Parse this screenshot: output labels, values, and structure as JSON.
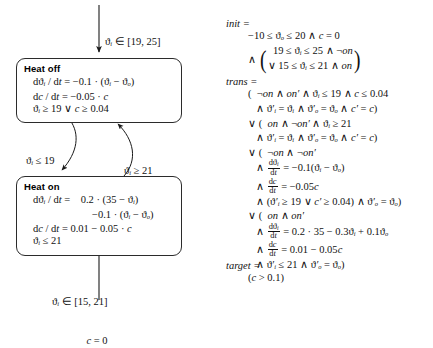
{
  "diagram": {
    "states": [
      {
        "id": "heat-off",
        "name": "Heat off",
        "lines": [
          "d ϑᵢ / d t = −0.1 · (ϑᵢ − ϑₒ)",
          "d c / d t = −0.05 · c",
          "ϑᵢ ≥ 19 ∨ c ≥ 0.04"
        ]
      },
      {
        "id": "heat-on",
        "name": "Heat on",
        "lines": [
          "d ϑᵢ / d t =    0.2 · (35 − ϑᵢ)",
          "−0.1 · (ϑᵢ − ϑₒ)",
          "d c / d t = 0.01 − 0.05 · c",
          "ϑᵢ ≤ 21"
        ]
      }
    ],
    "edges": [
      {
        "id": "init-into-heat-off",
        "direction": "down",
        "label": [
          "ϑᵢ ∈ [19, 25]",
          "c = 0"
        ]
      },
      {
        "id": "heat-off-to-heat-on",
        "direction": "down",
        "label": [
          "ϑᵢ ≤ 19",
          "c ≤ 0.04"
        ]
      },
      {
        "id": "heat-on-to-heat-off",
        "direction": "up",
        "label": [
          "ϑᵢ ≥ 21"
        ]
      },
      {
        "id": "init-into-heat-on",
        "direction": "up",
        "label": [
          "ϑᵢ ∈ [15, 21]",
          "c = 0"
        ]
      }
    ]
  },
  "spec": {
    "init": {
      "header": "init =",
      "first_line": "−10 ≤ ϑₒ ≤ 20 ∧ c = 0",
      "conj": "∧",
      "paren_rows": [
        "  19 ≤ ϑᵢ ≤ 25 ∧ ¬on",
        "∨ 15 ≤ ϑᵢ ≤ 21 ∧ on"
      ]
    },
    "trans": {
      "header": "trans =",
      "lines": [
        "(  ¬on ∧ on′ ∧ ϑᵢ ≤ 19 ∧ c ≤ 0.04",
        "∧ ϑ′ᵢ = ϑᵢ ∧ ϑ′ₒ = ϑₒ ∧ c′ = c)",
        "∨ (  on ∧ ¬on′ ∧ ϑᵢ ≥ 21",
        "∧ ϑ′ᵢ = ϑᵢ ∧ ϑ′ₒ = ϑₒ ∧ c′ = c)",
        "∨ (  ¬on ∧ ¬on′",
        "∧ dϑᵢ/dt = −0.1(ϑᵢ − ϑₒ)",
        "∧ dc/dt = −0.05c",
        "∧ (ϑ′ᵢ ≥ 19 ∨ c′ ≥ 0.04) ∧ ϑ′ₒ = ϑₒ)",
        "∨ (  on ∧ on′",
        "∧ dϑᵢ/dt = 0.2 · 35 − 0.3ϑᵢ + 0.1ϑₒ",
        "∧ dc/dt = 0.01 − 0.05c",
        "∧ ϑ′ᵢ ≤ 21 ∧ ϑ′ₒ = ϑₒ)"
      ]
    },
    "target": {
      "header": "target =",
      "line": "(c > 0.1)"
    }
  },
  "colors": {
    "ink": "#111111",
    "box_border": "#2b2b2b",
    "background": "#ffffff"
  }
}
